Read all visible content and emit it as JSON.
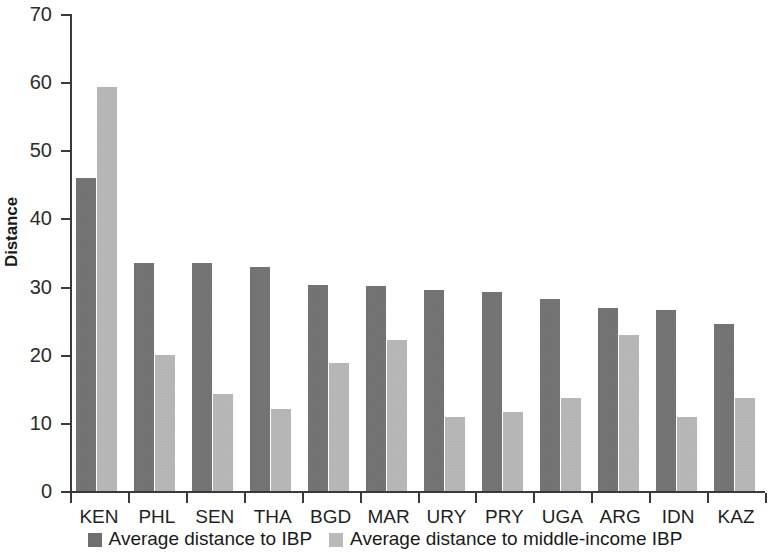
{
  "chart_data": {
    "type": "bar",
    "title": "",
    "subtitle": "",
    "xlabel": "",
    "ylabel": "Distance",
    "ylim": [
      0,
      70
    ],
    "yticks": [
      0,
      10,
      20,
      30,
      40,
      50,
      60,
      70
    ],
    "ytick_labels": [
      "0",
      "10",
      "20",
      "30",
      "40",
      "50",
      "60",
      "70"
    ],
    "grid": false,
    "legend_position": "bottom",
    "categories": [
      "KEN",
      "PHL",
      "SEN",
      "THA",
      "BGD",
      "MAR",
      "URY",
      "PRY",
      "UGA",
      "ARG",
      "IDN",
      "KAZ"
    ],
    "series": [
      {
        "name": "Average distance to IBP",
        "color": "#6e6e6e",
        "values": [
          46.0,
          33.5,
          33.4,
          32.9,
          30.3,
          30.1,
          29.5,
          29.2,
          28.2,
          26.9,
          26.5,
          24.5
        ]
      },
      {
        "name": "Average distance to middle-income IBP",
        "color": "#b9b9b9",
        "values": [
          59.3,
          19.9,
          14.3,
          12.1,
          18.8,
          22.2,
          10.8,
          11.6,
          13.6,
          22.9,
          10.9,
          13.6
        ]
      }
    ]
  },
  "legend": {
    "items": [
      {
        "label": "Average distance to IBP",
        "color": "#6e6e6e"
      },
      {
        "label": "Average distance to middle-income IBP",
        "color": "#b9b9b9"
      }
    ]
  },
  "axes": {
    "y_title": "Distance"
  }
}
